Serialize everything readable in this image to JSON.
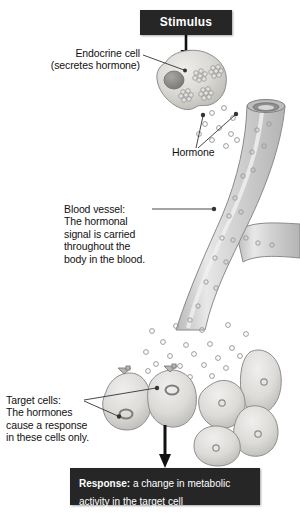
{
  "diagram": {
    "stimulus_box": {
      "label": "Stimulus"
    },
    "response_box": {
      "lead": "Response:",
      "text": " a change in metabolic activity in the target cell"
    },
    "labels": {
      "endocrine": "Endocrine cell\n(secretes hormone)",
      "hormone": "Hormone",
      "blood_vessel": "Blood vessel:\nThe hormonal\nsignal is carried\nthroughout the\nbody in the blood.",
      "target_cells": "Target cells:\nThe hormones\ncause a response\nin these cells only."
    },
    "colors": {
      "box_fill": "#262626",
      "box_text": "#ffffff",
      "cell_fill": "#d8d6d2",
      "cell_stroke": "#8d8d8d",
      "nucleus_fill": "#9a9a9a",
      "vessel_fill": "#cfcfcf",
      "vessel_stroke": "#8a8a8a",
      "hormone_stroke": "#9c9c9c",
      "arrow_black": "#111111",
      "leader_line": "#333333",
      "background": "#ffffff"
    },
    "parts": {
      "endocrine_cell": "endocrine-cell",
      "vesicle_clusters": 4,
      "vesicles_per_cluster": 7,
      "blood_vessel": "branched-blood-vessel",
      "target_cells": 2,
      "nontarget_cells": 4,
      "hormone_particles": "scattered small rings"
    }
  }
}
